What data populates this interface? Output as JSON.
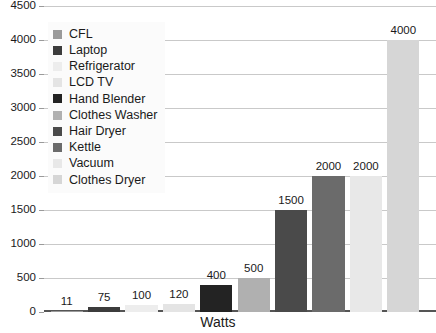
{
  "chart_data": {
    "type": "bar",
    "title": "",
    "xlabel": "Watts",
    "ylabel": "",
    "ylim": [
      0,
      4500
    ],
    "ytick_step": 500,
    "grid": true,
    "legend_position": "top-left",
    "categories": [
      "CFL",
      "Laptop",
      "Refrigerator",
      "LCD TV",
      "Hand Blender",
      "Clothes Washer",
      "Hair Dryer",
      "Kettle",
      "Vacuum",
      "Clothes Dryer"
    ],
    "values": [
      11,
      75,
      100,
      120,
      400,
      500,
      1500,
      2000,
      2000,
      4000
    ],
    "value_labels": [
      "11",
      "75",
      "100",
      "120",
      "400",
      "500",
      "1500",
      "2000",
      "2000",
      "4000"
    ],
    "colors": [
      "#9a9a9a",
      "#3c3c3c",
      "#ededed",
      "#e4e4e4",
      "#232323",
      "#b0b0b0",
      "#4a4a4a",
      "#6b6b6b",
      "#e8e8e8",
      "#d6d6d6"
    ],
    "ytick_labels": [
      "4500",
      "4000",
      "3500",
      "3000",
      "2500",
      "2000",
      "1500",
      "1000",
      "500",
      "0"
    ],
    "ytick_values": [
      4500,
      4000,
      3500,
      3000,
      2500,
      2000,
      1500,
      1000,
      500,
      0
    ]
  },
  "axis": {
    "x_title": "Watts"
  },
  "legend": {
    "entries": [
      {
        "label": "CFL",
        "color": "#9a9a9a"
      },
      {
        "label": "Laptop",
        "color": "#3c3c3c"
      },
      {
        "label": "Refrigerator",
        "color": "#ededed"
      },
      {
        "label": "LCD TV",
        "color": "#e4e4e4"
      },
      {
        "label": "Hand Blender",
        "color": "#232323"
      },
      {
        "label": "Clothes Washer",
        "color": "#b0b0b0"
      },
      {
        "label": "Hair Dryer",
        "color": "#4a4a4a"
      },
      {
        "label": "Kettle",
        "color": "#6b6b6b"
      },
      {
        "label": "Vacuum",
        "color": "#e8e8e8"
      },
      {
        "label": "Clothes Dryer",
        "color": "#d6d6d6"
      }
    ]
  }
}
